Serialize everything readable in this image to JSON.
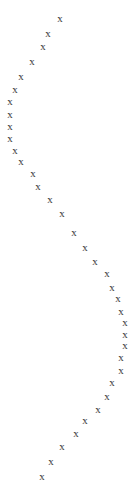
{
  "plot": {
    "type": "scatter-thumbnail",
    "width": 135,
    "height": 493,
    "background_color": "#ffffff",
    "marker_glyph": "x",
    "marker_color": "#3a3a3a",
    "marker_font_size_px": 11,
    "has_axes": false,
    "has_gridlines": false,
    "has_title": false,
    "has_legend": false,
    "has_tick_labels": false
  },
  "chart_data": {
    "type": "scatter",
    "title": "",
    "xlabel": "",
    "ylabel": "",
    "xlim": [
      0,
      135
    ],
    "ylim": [
      493,
      0
    ],
    "grid": false,
    "legend": null,
    "marker": "x",
    "series": [
      {
        "name": "series-1",
        "points": [
          {
            "x": 60,
            "y": 18
          },
          {
            "x": 48,
            "y": 33
          },
          {
            "x": 43,
            "y": 46
          },
          {
            "x": 32,
            "y": 61
          },
          {
            "x": 21,
            "y": 76
          },
          {
            "x": 15,
            "y": 89
          },
          {
            "x": 10,
            "y": 101
          },
          {
            "x": 10,
            "y": 114
          },
          {
            "x": 10,
            "y": 126
          },
          {
            "x": 10,
            "y": 138
          },
          {
            "x": 15,
            "y": 150
          },
          {
            "x": 21,
            "y": 161
          },
          {
            "x": 33,
            "y": 173
          },
          {
            "x": 38,
            "y": 186
          },
          {
            "x": 50,
            "y": 199
          },
          {
            "x": 62,
            "y": 213
          },
          {
            "x": 74,
            "y": 232
          },
          {
            "x": 85,
            "y": 247
          },
          {
            "x": 95,
            "y": 261
          },
          {
            "x": 107,
            "y": 273
          },
          {
            "x": 112,
            "y": 287
          },
          {
            "x": 118,
            "y": 298
          },
          {
            "x": 121,
            "y": 311
          },
          {
            "x": 125,
            "y": 322
          },
          {
            "x": 125,
            "y": 334
          },
          {
            "x": 125,
            "y": 345
          },
          {
            "x": 121,
            "y": 357
          },
          {
            "x": 121,
            "y": 370
          },
          {
            "x": 112,
            "y": 382
          },
          {
            "x": 107,
            "y": 396
          },
          {
            "x": 98,
            "y": 409
          },
          {
            "x": 85,
            "y": 420
          },
          {
            "x": 76,
            "y": 433
          },
          {
            "x": 62,
            "y": 446
          },
          {
            "x": 51,
            "y": 461
          },
          {
            "x": 42,
            "y": 476
          }
        ]
      }
    ]
  }
}
